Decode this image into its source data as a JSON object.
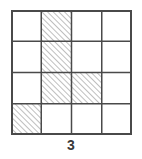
{
  "figure": {
    "type": "grid-shading-puzzle",
    "caption": "3",
    "background_color": "#ffffff",
    "grid": {
      "rows": 4,
      "columns": 4,
      "cell_width_px": 30.25,
      "cell_height_px": 31.25,
      "left_px": 11,
      "top_px": 10,
      "width_px": 121,
      "height_px": 125,
      "line_color": "#4a4a4a",
      "outer_line_width_px": 2,
      "inner_line_width_px": 1.5,
      "cell_fill_color": "#ffffff"
    },
    "hatch": {
      "style": "diagonal-45-up",
      "line_color": "#8a8a8a",
      "line_width_px": 1,
      "spacing_px": 4,
      "fill_color": "#ffffff"
    },
    "cells": [
      {
        "row": 0,
        "col": 0,
        "shaded": false
      },
      {
        "row": 0,
        "col": 1,
        "shaded": true
      },
      {
        "row": 0,
        "col": 2,
        "shaded": false
      },
      {
        "row": 0,
        "col": 3,
        "shaded": false
      },
      {
        "row": 1,
        "col": 0,
        "shaded": false
      },
      {
        "row": 1,
        "col": 1,
        "shaded": true
      },
      {
        "row": 1,
        "col": 2,
        "shaded": false
      },
      {
        "row": 1,
        "col": 3,
        "shaded": false
      },
      {
        "row": 2,
        "col": 0,
        "shaded": false
      },
      {
        "row": 2,
        "col": 1,
        "shaded": true
      },
      {
        "row": 2,
        "col": 2,
        "shaded": true
      },
      {
        "row": 2,
        "col": 3,
        "shaded": false
      },
      {
        "row": 3,
        "col": 0,
        "shaded": true
      },
      {
        "row": 3,
        "col": 1,
        "shaded": false
      },
      {
        "row": 3,
        "col": 2,
        "shaded": false
      },
      {
        "row": 3,
        "col": 3,
        "shaded": false
      }
    ],
    "shaded_count": 5
  }
}
